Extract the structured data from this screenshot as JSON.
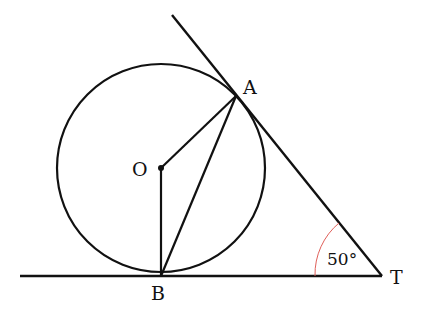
{
  "diagram": {
    "labels": {
      "A": "A",
      "O": "O",
      "B": "B",
      "T": "T",
      "angle": "50°"
    },
    "colors": {
      "stroke": "#111111",
      "angle_arc": "#e0605a"
    },
    "angle_degrees": 50
  }
}
